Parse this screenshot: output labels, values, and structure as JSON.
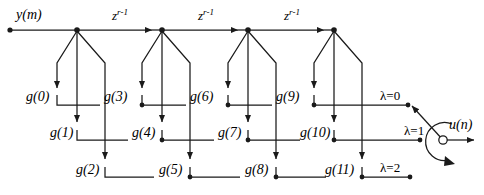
{
  "figure": {
    "type": "signal-flow-graph",
    "title_visible": false,
    "input_label": "y(m)",
    "output_label": "u(n)",
    "delay_label": "z",
    "delay_exponent": "r-1",
    "delay_label_full": "z r-1",
    "delay_count": 3,
    "tap_count": 12,
    "row_count": 3
  },
  "colors": {
    "line": "#1a1a1a",
    "text": "#000000",
    "background": "#ffffff"
  },
  "geometry": {
    "top_rail_y": 30,
    "rows_y": [
      105,
      140,
      177
    ],
    "node_x": [
      77,
      162,
      248,
      334
    ],
    "input_dot_x": 10,
    "commutator_x": 443,
    "commutator_y": 140,
    "output_arrow_x": 481
  },
  "delays": [
    {
      "id": "delay-1",
      "label": "z",
      "exponent": "r-1",
      "x": 119,
      "y": 16
    },
    {
      "id": "delay-2",
      "label": "z",
      "exponent": "r-1",
      "x": 205,
      "y": 16
    },
    {
      "id": "delay-3",
      "label": "z",
      "exponent": "r-1",
      "x": 291,
      "y": 16
    }
  ],
  "taps": [
    {
      "id": "tap-g0",
      "label": "g(0)",
      "stage": 0,
      "row": 0,
      "x": 28,
      "y": 98
    },
    {
      "id": "tap-g1",
      "label": "g(1)",
      "stage": 0,
      "row": 1,
      "x": 52,
      "y": 134
    },
    {
      "id": "tap-g2",
      "label": "g(2)",
      "stage": 0,
      "row": 2,
      "x": 78,
      "y": 171
    },
    {
      "id": "tap-g3",
      "label": "g(3)",
      "stage": 1,
      "row": 0,
      "x": 106,
      "y": 98
    },
    {
      "id": "tap-g4",
      "label": "g(4)",
      "stage": 1,
      "row": 1,
      "x": 134,
      "y": 134
    },
    {
      "id": "tap-g5",
      "label": "g(5)",
      "stage": 1,
      "row": 2,
      "x": 161,
      "y": 171
    },
    {
      "id": "tap-g6",
      "label": "g(6)",
      "stage": 2,
      "row": 0,
      "x": 192,
      "y": 98
    },
    {
      "id": "tap-g7",
      "label": "g(7)",
      "stage": 2,
      "row": 1,
      "x": 220,
      "y": 134
    },
    {
      "id": "tap-g8",
      "label": "g(8)",
      "stage": 2,
      "row": 2,
      "x": 247,
      "y": 171
    },
    {
      "id": "tap-g9",
      "label": "g(9)",
      "stage": 3,
      "row": 0,
      "x": 278,
      "y": 98
    },
    {
      "id": "tap-g10",
      "label": "g(10)",
      "stage": 3,
      "row": 1,
      "x": 302,
      "y": 134
    },
    {
      "id": "tap-g11",
      "label": "g(11)",
      "stage": 3,
      "row": 2,
      "x": 327,
      "y": 171
    }
  ],
  "rows": [
    {
      "id": "row-lambda-0",
      "label": "λ=0",
      "y": 105,
      "label_x": 382,
      "label_y": 92,
      "end_x": 414
    },
    {
      "id": "row-lambda-1",
      "label": "λ=1",
      "y": 140,
      "label_x": 406,
      "label_y": 127,
      "end_x": 424
    },
    {
      "id": "row-lambda-2",
      "label": "λ=2",
      "y": 177,
      "label_x": 382,
      "label_y": 164,
      "end_x": 414
    }
  ],
  "input": {
    "label": "y(m)",
    "x": 16,
    "y": 14
  },
  "output": {
    "label": "u(n)",
    "x": 449,
    "y": 124
  }
}
